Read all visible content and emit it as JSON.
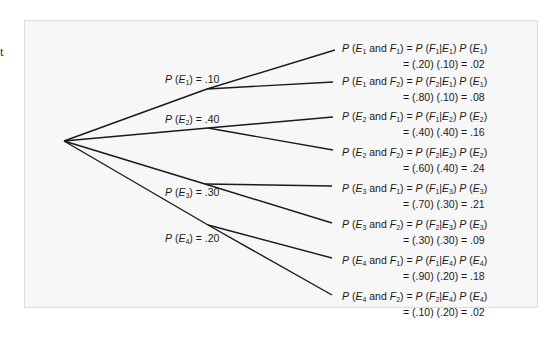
{
  "margin_fragment": "t",
  "root": {
    "label": ""
  },
  "first_level": [
    {
      "label": "P (E1) = .10",
      "event": "E1",
      "prob": ".10"
    },
    {
      "label": "P (E2) = .40",
      "event": "E2",
      "prob": ".40"
    },
    {
      "label": "P (E3) = .30",
      "event": "E3",
      "prob": ".30"
    },
    {
      "label": "P (E4) = .20",
      "event": "E4",
      "prob": ".20"
    }
  ],
  "leaves": [
    {
      "e": "1",
      "f": "1",
      "calc": "= (.20) (.10) = .02"
    },
    {
      "e": "1",
      "f": "2",
      "calc": "= (.80) (.10) = .08"
    },
    {
      "e": "2",
      "f": "1",
      "calc": "= (.40) (.40) = .16"
    },
    {
      "e": "2",
      "f": "2",
      "calc": "= (.60) (.40) = .24"
    },
    {
      "e": "3",
      "f": "1",
      "calc": "= (.70) (.30) = .21"
    },
    {
      "e": "3",
      "f": "2",
      "calc": "= (.30) (.30) = .09"
    },
    {
      "e": "4",
      "f": "1",
      "calc": "= (.90) (.20) = .18"
    },
    {
      "e": "4",
      "f": "2",
      "calc": "= (.10) (.20) = .02"
    }
  ],
  "text": {
    "P": "P",
    "and": "and",
    "eq": "="
  },
  "colors": {
    "line": "#1a1a1a",
    "panel": "#f7f7f7",
    "border": "#dcdcdc"
  }
}
